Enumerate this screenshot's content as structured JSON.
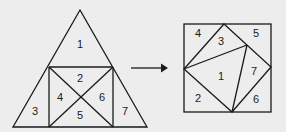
{
  "diagram": {
    "left_figure": {
      "shape": "triangle",
      "pieces": [
        {
          "id": "1",
          "label": "1",
          "x": 80,
          "y": 44
        },
        {
          "id": "2",
          "label": "2",
          "x": 80,
          "y": 78
        },
        {
          "id": "3",
          "label": "3",
          "x": 35,
          "y": 110
        },
        {
          "id": "4",
          "label": "4",
          "x": 60,
          "y": 97
        },
        {
          "id": "5",
          "label": "5",
          "x": 80,
          "y": 115
        },
        {
          "id": "6",
          "label": "6",
          "x": 102,
          "y": 97
        },
        {
          "id": "7",
          "label": "7",
          "x": 125,
          "y": 110
        }
      ]
    },
    "arrow": {
      "direction": "right"
    },
    "right_figure": {
      "shape": "square",
      "pieces": [
        {
          "id": "1",
          "label": "1",
          "x": 221,
          "y": 75
        },
        {
          "id": "2",
          "label": "2",
          "x": 198,
          "y": 97
        },
        {
          "id": "3",
          "label": "3",
          "x": 221,
          "y": 41
        },
        {
          "id": "4",
          "label": "4",
          "x": 198,
          "y": 33
        },
        {
          "id": "5",
          "label": "5",
          "x": 256,
          "y": 33
        },
        {
          "id": "6",
          "label": "6",
          "x": 256,
          "y": 98
        },
        {
          "id": "7",
          "label": "7",
          "x": 254,
          "y": 71
        }
      ]
    }
  }
}
